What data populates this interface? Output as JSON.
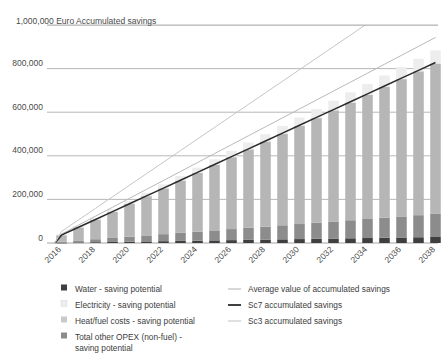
{
  "chart_data": {
    "type": "bar",
    "title": "1,000,000 Euro Accumulated savings",
    "xlabel": "",
    "ylabel": "Euro Accumulated savings",
    "ylim": [
      0,
      1000000
    ],
    "ytick_labels": [
      "1,000,000",
      "800,000",
      "600,000",
      "400,000",
      "200,000",
      "0"
    ],
    "ytick_values": [
      1000000,
      800000,
      600000,
      400000,
      200000,
      0
    ],
    "grid": true,
    "legend_position": "bottom",
    "categories": [
      2016,
      2017,
      2018,
      2019,
      2020,
      2021,
      2022,
      2023,
      2024,
      2025,
      2026,
      2027,
      2028,
      2029,
      2030,
      2031,
      2032,
      2033,
      2034,
      2035,
      2036,
      2037,
      2038
    ],
    "xtick_labels": [
      "2016",
      "2018",
      "2020",
      "2022",
      "2024",
      "2026",
      "2028",
      "2030",
      "2032",
      "2034",
      "2036",
      "2038"
    ],
    "series": [
      {
        "name": "Water - saving potential",
        "kind": "bar-segment",
        "color": "#3f3f3f",
        "values": [
          1200,
          2400,
          3600,
          4800,
          6000,
          7200,
          8400,
          9600,
          10800,
          12000,
          13200,
          14400,
          15600,
          16800,
          18000,
          19200,
          20400,
          21600,
          22800,
          24000,
          25200,
          26400,
          27600
        ]
      },
      {
        "name": "Electricity - saving potential",
        "kind": "bar-segment",
        "color": "#ededed",
        "values": [
          2600,
          5200,
          7800,
          10400,
          13000,
          15600,
          18200,
          20800,
          23400,
          26000,
          28600,
          31200,
          33800,
          36400,
          39000,
          41600,
          44200,
          46800,
          49400,
          52000,
          54600,
          57200,
          59800
        ]
      },
      {
        "name": "Heat/fuel costs - saving potential",
        "kind": "bar-segment",
        "color": "#b6b6b6",
        "values": [
          30000,
          60000,
          90000,
          120000,
          150000,
          180000,
          210000,
          240000,
          270000,
          300000,
          330000,
          360000,
          390000,
          420000,
          450000,
          480000,
          510000,
          540000,
          570000,
          600000,
          630000,
          660000,
          690000
        ]
      },
      {
        "name": "Total other OPEX (non-fuel) - saving potential",
        "kind": "bar-segment",
        "color": "#8c8c8c",
        "values": [
          4600,
          9200,
          13800,
          18400,
          23000,
          27600,
          32200,
          36800,
          41400,
          46000,
          50600,
          55200,
          59800,
          64400,
          69000,
          73600,
          78200,
          82800,
          87400,
          92000,
          96600,
          101200,
          105800
        ]
      },
      {
        "name": "Average value of accumulated savings",
        "kind": "line",
        "color": "#b9b9b9",
        "values": [
          41000,
          82000,
          123000,
          164000,
          205000,
          246000,
          287000,
          328000,
          369000,
          410000,
          451000,
          492000,
          533000,
          574000,
          615000,
          656000,
          697000,
          738000,
          779000,
          820000,
          861000,
          902000,
          943000
        ]
      },
      {
        "name": "Sc7 accumulated savings",
        "kind": "line",
        "color": "#2b2b2b",
        "values": [
          36000,
          72000,
          108000,
          144000,
          180000,
          216000,
          252000,
          288000,
          324000,
          360000,
          396000,
          432000,
          468000,
          504000,
          540000,
          576000,
          612000,
          648000,
          684000,
          720000,
          756000,
          792000,
          828000
        ]
      },
      {
        "name": "Sc3 accumulated savings",
        "kind": "line",
        "color": "#c6c6c6",
        "values": [
          53000,
          106000,
          159000,
          212000,
          265000,
          318000,
          371000,
          424000,
          477000,
          530000,
          583000,
          636000,
          689000,
          742000,
          795000,
          848000,
          901000,
          954000,
          1007000,
          1060000,
          1113000,
          1166000,
          1219000
        ]
      }
    ]
  },
  "legend": {
    "left_items": [
      {
        "label": "Water - saving potential",
        "swatch": "#3f3f3f",
        "type": "square"
      },
      {
        "label": "Electricity - saving potential",
        "swatch": "#ededed",
        "type": "square"
      },
      {
        "label": "Heat/fuel costs - saving potential",
        "swatch": "#c9c9c9",
        "type": "square"
      },
      {
        "label": "Total other OPEX (non-fuel) - saving potential",
        "swatch": "#8c8c8c",
        "type": "square"
      }
    ],
    "right_items": [
      {
        "label": "Average value of accumulated savings",
        "swatch": "#b9b9b9",
        "type": "line"
      },
      {
        "label": "Sc7 accumulated savings",
        "swatch": "#2b2b2b",
        "type": "line"
      },
      {
        "label": "Sc3 accumulated savings",
        "swatch": "#c6c6c6",
        "type": "line"
      }
    ]
  }
}
